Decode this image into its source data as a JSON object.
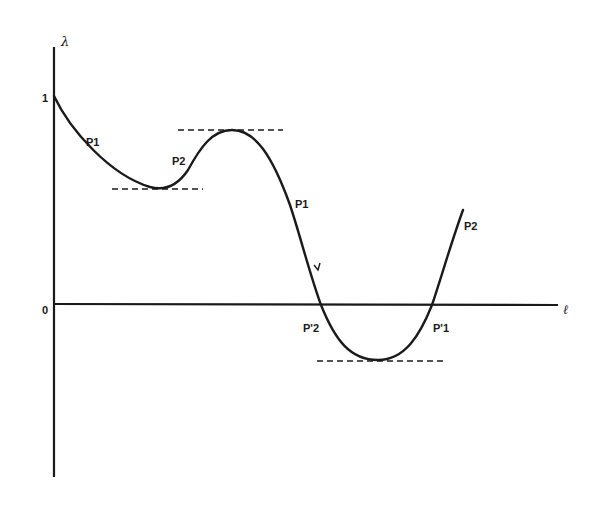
{
  "diagram": {
    "axes": {
      "y_label": "λ",
      "x_label": "ℓ",
      "y_ticks": [
        {
          "label": "1",
          "value": 1
        },
        {
          "label": "0",
          "value": 0
        }
      ]
    },
    "curve_labels": [
      {
        "id": "p1-upper-left",
        "text": "P1"
      },
      {
        "id": "p2-upper",
        "text": "P2"
      },
      {
        "id": "p1-descending",
        "text": "P1"
      },
      {
        "id": "p2-right",
        "text": "P2"
      },
      {
        "id": "p2-prime",
        "text": "P'2"
      },
      {
        "id": "p1-prime",
        "text": "P'1"
      }
    ],
    "extrema_guides": [
      {
        "type": "local-minimum",
        "style": "dashed"
      },
      {
        "type": "local-maximum",
        "style": "dashed"
      },
      {
        "type": "global-minimum",
        "style": "dashed"
      }
    ],
    "colors": {
      "ink": "#1a1a1a",
      "background": "#ffffff"
    }
  }
}
